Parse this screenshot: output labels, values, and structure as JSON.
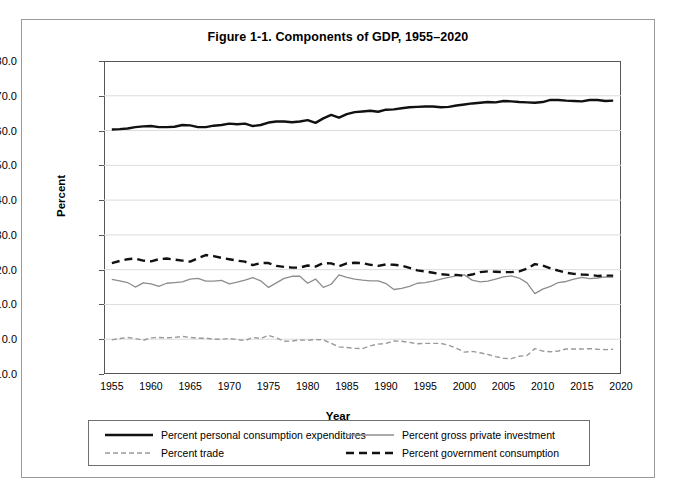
{
  "figure": {
    "title": "Figure 1-1. Components of GDP, 1955–2020"
  },
  "axes": {
    "ylabel": "Percent",
    "xlabel": "Year",
    "yticks": [
      "80.0",
      "70.0",
      "60.0",
      "50.0",
      "40.0",
      "30.0",
      "20.0",
      "10.0",
      "0.0",
      "-10.0"
    ],
    "xticks": [
      "1955",
      "1960",
      "1965",
      "1970",
      "1975",
      "1980",
      "1985",
      "1990",
      "1995",
      "2000",
      "2005",
      "2010",
      "2015",
      "2020"
    ]
  },
  "legend": {
    "items": [
      {
        "label": "Percent personal consumption expenditures",
        "style": "thick-solid-black"
      },
      {
        "label": "Percent gross private investment",
        "style": "thin-solid-gray"
      },
      {
        "label": "Percent trade",
        "style": "thin-dashed-gray"
      },
      {
        "label": "Percent government consumption",
        "style": "thick-dashed-black"
      }
    ]
  },
  "colors": {
    "pce": "#111111",
    "investment": "#8d8d8d",
    "trade": "#9a9a9a",
    "government": "#111111",
    "grid": "#dcdcdc",
    "axis": "#555555",
    "frame": "#9a9a9a"
  },
  "chart_data": {
    "type": "line",
    "title": "Figure 1-1. Components of GDP, 1955–2020",
    "xlabel": "Year",
    "ylabel": "Percent",
    "xlim": [
      1954,
      2020
    ],
    "ylim": [
      -10,
      80
    ],
    "ytick_step": 10,
    "xtick_step": 5,
    "grid": "horizontal",
    "legend_position": "below",
    "x": [
      1955,
      1956,
      1957,
      1958,
      1959,
      1960,
      1961,
      1962,
      1963,
      1964,
      1965,
      1966,
      1967,
      1968,
      1969,
      1970,
      1971,
      1972,
      1973,
      1974,
      1975,
      1976,
      1977,
      1978,
      1979,
      1980,
      1981,
      1982,
      1983,
      1984,
      1985,
      1986,
      1987,
      1988,
      1989,
      1990,
      1991,
      1992,
      1993,
      1994,
      1995,
      1996,
      1997,
      1998,
      1999,
      2000,
      2001,
      2002,
      2003,
      2004,
      2005,
      2006,
      2007,
      2008,
      2009,
      2010,
      2011,
      2012,
      2013,
      2014,
      2015,
      2016,
      2017,
      2018,
      2019
    ],
    "series": [
      {
        "name": "Percent personal consumption expenditures",
        "style": "thick-solid-black",
        "values": [
          60.3,
          60.4,
          60.6,
          61.0,
          61.2,
          61.3,
          61.0,
          61.0,
          61.1,
          61.6,
          61.5,
          61.0,
          61.0,
          61.4,
          61.6,
          62.0,
          61.8,
          62.0,
          61.3,
          61.6,
          62.3,
          62.6,
          62.6,
          62.4,
          62.6,
          63.0,
          62.2,
          63.5,
          64.5,
          63.7,
          64.7,
          65.3,
          65.5,
          65.7,
          65.4,
          66.0,
          66.1,
          66.4,
          66.7,
          66.8,
          66.9,
          66.9,
          66.7,
          66.8,
          67.2,
          67.5,
          67.8,
          68.0,
          68.2,
          68.1,
          68.5,
          68.4,
          68.2,
          68.1,
          68.0,
          68.2,
          68.8,
          68.8,
          68.6,
          68.5,
          68.4,
          68.8,
          68.8,
          68.5,
          68.6
        ]
      },
      {
        "name": "Percent gross private investment",
        "style": "thin-solid-gray",
        "values": [
          17.2,
          16.8,
          16.3,
          15.0,
          16.2,
          15.9,
          15.2,
          16.1,
          16.3,
          16.5,
          17.3,
          17.5,
          16.7,
          16.7,
          16.9,
          15.9,
          16.4,
          17.0,
          17.7,
          16.8,
          14.9,
          16.2,
          17.5,
          18.1,
          18.1,
          16.1,
          17.3,
          14.9,
          15.8,
          18.5,
          17.8,
          17.3,
          17.0,
          16.8,
          16.8,
          16.0,
          14.3,
          14.6,
          15.2,
          16.1,
          16.3,
          16.7,
          17.3,
          17.8,
          18.2,
          18.5,
          17.0,
          16.5,
          16.7,
          17.3,
          17.9,
          18.2,
          17.6,
          16.2,
          13.1,
          14.4,
          15.2,
          16.3,
          16.6,
          17.3,
          17.8,
          17.4,
          17.6,
          17.9,
          17.8
        ]
      },
      {
        "name": "Percent trade",
        "style": "thin-dashed-gray",
        "values": [
          -0.2,
          0.2,
          0.5,
          0.2,
          -0.3,
          0.4,
          0.5,
          0.4,
          0.5,
          0.8,
          0.5,
          0.3,
          0.3,
          0.0,
          0.0,
          0.2,
          -0.1,
          -0.4,
          0.5,
          0.2,
          1.1,
          0.4,
          -0.6,
          -0.5,
          -0.2,
          -0.3,
          -0.1,
          -0.2,
          -1.2,
          -2.2,
          -2.4,
          -2.6,
          -2.7,
          -1.9,
          -1.4,
          -1.2,
          -0.5,
          -0.6,
          -0.9,
          -1.3,
          -1.2,
          -1.2,
          -1.2,
          -1.7,
          -2.6,
          -3.7,
          -3.5,
          -3.9,
          -4.4,
          -5.0,
          -5.5,
          -5.6,
          -4.9,
          -4.7,
          -2.7,
          -3.4,
          -3.6,
          -3.4,
          -2.8,
          -2.8,
          -2.8,
          -2.7,
          -2.9,
          -3.0,
          -2.9
        ]
      },
      {
        "name": "Percent government consumption",
        "style": "thick-dashed-black",
        "values": [
          21.9,
          22.5,
          23.0,
          23.2,
          22.6,
          22.4,
          23.0,
          23.2,
          22.9,
          22.6,
          22.3,
          23.3,
          24.2,
          23.9,
          23.4,
          23.0,
          22.6,
          22.3,
          21.3,
          21.9,
          21.9,
          21.1,
          20.8,
          20.6,
          20.6,
          21.2,
          20.9,
          21.9,
          21.8,
          21.0,
          21.8,
          22.0,
          21.9,
          21.4,
          21.1,
          21.5,
          21.4,
          21.2,
          20.5,
          19.8,
          19.5,
          19.1,
          18.7,
          18.5,
          18.5,
          18.2,
          18.6,
          19.3,
          19.5,
          19.4,
          19.3,
          19.3,
          19.5,
          20.3,
          21.6,
          21.2,
          20.4,
          19.7,
          19.1,
          18.8,
          18.6,
          18.5,
          18.2,
          18.3,
          18.3
        ]
      }
    ]
  }
}
